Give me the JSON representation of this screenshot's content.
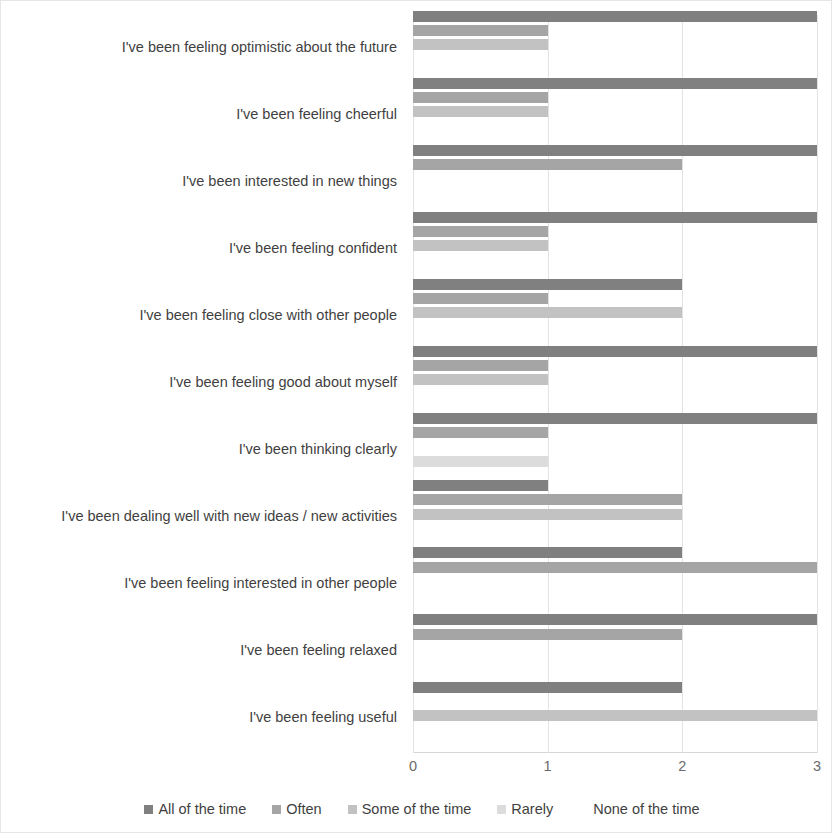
{
  "chart_data": {
    "type": "bar",
    "orientation": "horizontal",
    "title": "",
    "xlabel": "",
    "ylabel": "",
    "xlim": [
      0,
      3
    ],
    "xticks": [
      "0",
      "1",
      "2",
      "3"
    ],
    "grid": true,
    "legend_position": "bottom",
    "categories": [
      "I've been feeling optimistic about the future",
      "I've been feeling cheerful",
      "I've been interested in new things",
      "I've been feeling confident",
      "I've been feeling close with other people",
      "I've been feeling good about myself",
      "I've been thinking clearly",
      "I've been dealing well with new ideas / new activities",
      "I've been feeling interested in other people",
      "I've been feeling relaxed",
      "I've been feeling useful"
    ],
    "series": [
      {
        "name": "All of the time",
        "color": "#808080",
        "values": [
          3,
          3,
          3,
          3,
          2,
          3,
          3,
          1,
          2,
          3,
          2
        ]
      },
      {
        "name": "Often",
        "color": "#a5a5a5",
        "values": [
          1,
          1,
          2,
          1,
          1,
          1,
          1,
          2,
          3,
          2,
          0
        ]
      },
      {
        "name": "Some of the time",
        "color": "#c2c2c2",
        "values": [
          1,
          1,
          0,
          1,
          2,
          1,
          0,
          2,
          0,
          0,
          3
        ]
      },
      {
        "name": "Rarely",
        "color": "#dcdcdc",
        "values": [
          0,
          0,
          0,
          0,
          0,
          0,
          1,
          0,
          0,
          0,
          0
        ]
      },
      {
        "name": "None of the time",
        "color": "#f2f2f2",
        "values": [
          0,
          0,
          0,
          0,
          0,
          0,
          0,
          0,
          0,
          0,
          0
        ]
      }
    ]
  },
  "legend": {
    "items": [
      {
        "label": "All of the time",
        "color": "#808080"
      },
      {
        "label": "Often",
        "color": "#a5a5a5"
      },
      {
        "label": "Some of the time",
        "color": "#c2c2c2"
      },
      {
        "label": "Rarely",
        "color": "#dcdcdc"
      },
      {
        "label": "None of the time",
        "color": "#ffffff"
      }
    ]
  }
}
